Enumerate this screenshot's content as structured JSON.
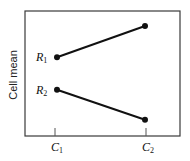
{
  "chart_data": {
    "type": "line",
    "title": "",
    "xlabel": "",
    "ylabel": "Cell mean",
    "categories": [
      "C1",
      "C2"
    ],
    "category_labels": [
      {
        "base": "C",
        "sub": "1"
      },
      {
        "base": "C",
        "sub": "2"
      }
    ],
    "series": [
      {
        "name": "R1",
        "label_base": "R",
        "label_sub": "1",
        "values": [
          6.3,
          8.8
        ]
      },
      {
        "name": "R2",
        "label_base": "R",
        "label_sub": "2",
        "values": [
          3.7,
          1.3
        ]
      }
    ],
    "ylim": [
      0,
      10
    ],
    "y_ticks_shown": false,
    "grid": false,
    "legend": "inline labels at left of series start points",
    "colors": {
      "line": "#111111",
      "frame": "#3a3a3a"
    }
  }
}
